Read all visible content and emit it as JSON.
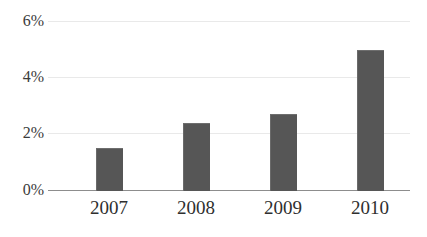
{
  "chart_data": {
    "type": "bar",
    "title": "",
    "subtitle": "",
    "xlabel": "",
    "ylabel": "",
    "categories": [
      "2007",
      "2008",
      "2009",
      "2010"
    ],
    "values": [
      1.5,
      2.4,
      2.7,
      5.0
    ],
    "value_unit": "%",
    "ylim": [
      0,
      6
    ],
    "ytick_values": [
      0,
      2,
      4,
      6
    ],
    "ytick_labels": [
      "0%",
      "2%",
      "4%",
      "6%"
    ],
    "grid": true,
    "grid_axis": "y",
    "legend": false,
    "legend_position": "none",
    "series": [
      {
        "name": "",
        "values": [
          1.5,
          2.4,
          2.7,
          5.0
        ]
      }
    ]
  },
  "style": {
    "bar_color": "#565656",
    "grid_color": "#e9e9e9",
    "axis_color": "#8d8d8d",
    "tick_label_color": "#3b3b3b",
    "category_label_color": "#2f2f2f",
    "background": "#ffffff"
  }
}
